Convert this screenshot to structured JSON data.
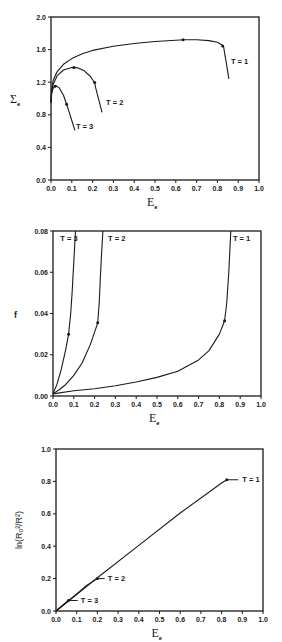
{
  "header_fragment": "",
  "chart_data": [
    {
      "id": "panel-stress",
      "type": "line",
      "title": "",
      "xlabel": "E",
      "xlabel_sub": "e",
      "ylabel": "Σ",
      "ylabel_sub": "e",
      "xlim": [
        0.0,
        1.0
      ],
      "ylim": [
        0.0,
        2.0
      ],
      "xticks": [
        "0.0",
        "0.1",
        "0.2",
        "0.3",
        "0.4",
        "0.5",
        "0.6",
        "0.7",
        "0.8",
        "0.9",
        "1.0"
      ],
      "xtick_values": [
        0.0,
        0.1,
        0.2,
        0.3,
        0.4,
        0.5,
        0.6,
        0.7,
        0.8,
        0.9,
        1.0
      ],
      "yticks": [
        "0.0",
        "0.4",
        "0.8",
        "1.2",
        "1.6",
        "2.0"
      ],
      "ytick_values": [
        0.0,
        0.4,
        0.8,
        1.2,
        1.6,
        2.0
      ],
      "grid": false,
      "legend": "inline labels",
      "box_px": {
        "left": 51,
        "top": 17,
        "right": 259,
        "bottom": 180
      },
      "series": [
        {
          "name": "T=1",
          "label": "T = 1",
          "label_pos": [
            0.865,
            1.45
          ],
          "x": [
            0.0,
            0.003,
            0.01,
            0.03,
            0.06,
            0.1,
            0.15,
            0.2,
            0.3,
            0.4,
            0.5,
            0.6,
            0.64,
            0.7,
            0.76,
            0.8,
            0.82,
            0.83,
            0.835,
            0.845,
            0.855
          ],
          "y": [
            0.95,
            1.1,
            1.22,
            1.33,
            1.42,
            1.49,
            1.55,
            1.59,
            1.64,
            1.675,
            1.7,
            1.715,
            1.72,
            1.72,
            1.71,
            1.69,
            1.66,
            1.635,
            1.55,
            1.4,
            1.24
          ],
          "markers": [
            [
              0.635,
              1.72
            ],
            [
              0.825,
              1.645
            ]
          ]
        },
        {
          "name": "T=2",
          "label": "T = 2",
          "label_pos": [
            0.265,
            0.95
          ],
          "x": [
            0.0,
            0.003,
            0.01,
            0.03,
            0.06,
            0.1,
            0.13,
            0.16,
            0.19,
            0.21,
            0.215,
            0.225,
            0.235,
            0.245
          ],
          "y": [
            0.95,
            1.08,
            1.17,
            1.28,
            1.35,
            1.38,
            1.375,
            1.34,
            1.27,
            1.19,
            1.13,
            1.03,
            0.93,
            0.83
          ],
          "markers": [
            [
              0.11,
              1.38
            ],
            [
              0.21,
              1.195
            ]
          ]
        },
        {
          "name": "T=3",
          "label": "T = 3",
          "label_pos": [
            0.12,
            0.66
          ],
          "x": [
            0.0,
            0.003,
            0.008,
            0.015,
            0.025,
            0.04,
            0.06,
            0.075,
            0.085,
            0.1,
            0.115
          ],
          "y": [
            0.95,
            1.05,
            1.11,
            1.145,
            1.155,
            1.13,
            1.04,
            0.93,
            0.85,
            0.73,
            0.61
          ],
          "markers": [
            [
              0.02,
              1.15
            ],
            [
              0.075,
              0.93
            ]
          ]
        }
      ]
    },
    {
      "id": "panel-porosity",
      "type": "line",
      "title": "",
      "xlabel": "E",
      "xlabel_sub": "e",
      "ylabel": "f",
      "ylabel_sub": "",
      "xlim": [
        0.0,
        1.0
      ],
      "ylim": [
        0.0,
        0.08
      ],
      "xticks": [
        "0.0",
        "0.1",
        "0.2",
        "0.3",
        "0.4",
        "0.5",
        "0.6",
        "0.7",
        "0.8",
        "0.9",
        "1.0"
      ],
      "xtick_values": [
        0.0,
        0.1,
        0.2,
        0.3,
        0.4,
        0.5,
        0.6,
        0.7,
        0.8,
        0.9,
        1.0
      ],
      "yticks": [
        "0.00",
        "0.02",
        "0.04",
        "0.06",
        "0.08"
      ],
      "ytick_values": [
        0.0,
        0.02,
        0.04,
        0.06,
        0.08
      ],
      "grid": false,
      "legend": "inline labels",
      "box_px": {
        "left": 53,
        "top": 231,
        "right": 261,
        "bottom": 396
      },
      "series": [
        {
          "name": "T=1",
          "label": "T = 1",
          "label_pos": [
            0.865,
            0.0765
          ],
          "x": [
            0.0,
            0.1,
            0.2,
            0.3,
            0.4,
            0.5,
            0.6,
            0.7,
            0.75,
            0.8,
            0.825,
            0.835,
            0.845,
            0.85,
            0.855
          ],
          "y": [
            0.001,
            0.0025,
            0.0035,
            0.005,
            0.0068,
            0.009,
            0.012,
            0.0175,
            0.022,
            0.03,
            0.0365,
            0.045,
            0.06,
            0.07,
            0.08
          ],
          "markers": [
            [
              0.825,
              0.0365
            ]
          ]
        },
        {
          "name": "T=2",
          "label": "T = 2",
          "label_pos": [
            0.265,
            0.0765
          ],
          "x": [
            0.0,
            0.03,
            0.06,
            0.1,
            0.14,
            0.18,
            0.2,
            0.215,
            0.222,
            0.228,
            0.234,
            0.24
          ],
          "y": [
            0.001,
            0.003,
            0.0055,
            0.01,
            0.016,
            0.025,
            0.031,
            0.0355,
            0.045,
            0.058,
            0.07,
            0.08
          ],
          "markers": [
            [
              0.215,
              0.0355
            ]
          ]
        },
        {
          "name": "T=3",
          "label": "T = 3",
          "label_pos": [
            0.035,
            0.0765
          ],
          "x": [
            0.0,
            0.02,
            0.04,
            0.06,
            0.075,
            0.085,
            0.092,
            0.1,
            0.108
          ],
          "y": [
            0.001,
            0.006,
            0.013,
            0.022,
            0.03,
            0.04,
            0.05,
            0.065,
            0.08
          ],
          "markers": [
            [
              0.075,
              0.03
            ]
          ]
        }
      ]
    },
    {
      "id": "panel-radius",
      "type": "line",
      "title": "",
      "xlabel": "E",
      "xlabel_sub": "e",
      "ylabel": "ln(R₀²/R²)",
      "ylabel_sub": "",
      "xlim": [
        0.0,
        1.0
      ],
      "ylim": [
        0.0,
        1.0
      ],
      "xticks": [
        "0.0",
        "0.1",
        "0.2",
        "0.3",
        "0.4",
        "0.5",
        "0.6",
        "0.7",
        "0.8",
        "0.9",
        "1.0"
      ],
      "xtick_values": [
        0.0,
        0.1,
        0.2,
        0.3,
        0.4,
        0.5,
        0.6,
        0.7,
        0.8,
        0.9,
        1.0
      ],
      "yticks": [
        "0.0",
        "0.2",
        "0.4",
        "0.6",
        "0.8",
        "1.0"
      ],
      "ytick_values": [
        0.0,
        0.2,
        0.4,
        0.6,
        0.8,
        1.0
      ],
      "grid": false,
      "legend": "inline labels with leader lines",
      "box_px": {
        "left": 56,
        "top": 449,
        "right": 263,
        "bottom": 611
      },
      "series": [
        {
          "name": "T=1",
          "label": "T = 1",
          "label_pos": [
            0.9,
            0.81
          ],
          "leader": [
            [
              0.825,
              0.81
            ],
            [
              0.88,
              0.81
            ]
          ],
          "x": [
            0.0,
            0.2,
            0.4,
            0.6,
            0.8,
            0.825
          ],
          "y": [
            0.0,
            0.205,
            0.405,
            0.605,
            0.79,
            0.81
          ],
          "markers": [
            [
              0.825,
              0.81
            ]
          ]
        },
        {
          "name": "T=2",
          "label": "T = 2",
          "label_pos": [
            0.25,
            0.2
          ],
          "leader": [
            [
              0.2,
              0.2
            ],
            [
              0.235,
              0.2
            ]
          ],
          "x": [
            0.0,
            0.1,
            0.15,
            0.2
          ],
          "y": [
            0.0,
            0.105,
            0.16,
            0.2
          ],
          "markers": [
            [
              0.2,
              0.2
            ]
          ]
        },
        {
          "name": "T=3",
          "label": "T = 3",
          "label_pos": [
            0.12,
            0.063
          ],
          "leader": [
            [
              0.06,
              0.065
            ],
            [
              0.105,
              0.065
            ]
          ],
          "x": [
            0.0,
            0.03,
            0.06
          ],
          "y": [
            0.0,
            0.033,
            0.065
          ],
          "markers": [
            [
              0.06,
              0.065
            ]
          ]
        }
      ]
    }
  ]
}
